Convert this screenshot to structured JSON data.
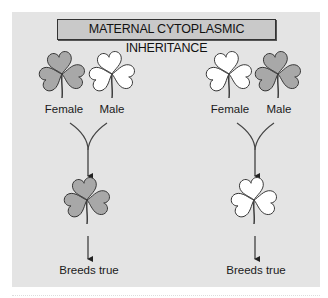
{
  "title": "MATERNAL CYTOPLASMIC INHERITANCE",
  "colors": {
    "background": "#e4e4e4",
    "title_box": "#c9c9c9",
    "gray_leaf": "#a8a8a8",
    "white_leaf": "#ffffff",
    "stroke": "#333333"
  },
  "crosses": [
    {
      "parents": [
        {
          "label": "Female",
          "leaf_color": "gray"
        },
        {
          "label": "Male",
          "leaf_color": "white"
        }
      ],
      "offspring": {
        "leaf_color": "gray"
      },
      "result_label": "Breeds true"
    },
    {
      "parents": [
        {
          "label": "Female",
          "leaf_color": "white"
        },
        {
          "label": "Male",
          "leaf_color": "gray"
        }
      ],
      "offspring": {
        "leaf_color": "white"
      },
      "result_label": "Breeds true"
    }
  ]
}
